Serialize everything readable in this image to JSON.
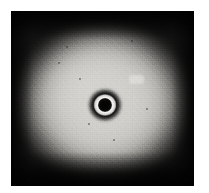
{
  "figure": {
    "kind": "photographic-plate-image",
    "caption": "",
    "alt_text": "Grayscale photographic plate showing a broad diffuse bright halo on a dark background with a sharp dark central spot encircled by a thin bright ring",
    "width_px": 209,
    "height_px": 193
  },
  "plate": {
    "label": "plate",
    "left_px": 11,
    "top_px": 11,
    "width_px": 183,
    "height_px": 175,
    "background_color": "#0a0a0a",
    "paper_margin_color": "#ffffff"
  },
  "halo": {
    "label": "diffuse halo",
    "center_x_px": 105,
    "center_y_px": 102,
    "outer_width_px": 196,
    "outer_height_px": 178,
    "peak_gray": "#d0cfcb",
    "edge_gray": "#101010",
    "shape": "ellipse"
  },
  "center_spot": {
    "label": "central spot",
    "center_x_px": 105,
    "center_y_px": 105,
    "core_diameter_px": 14,
    "ring_diameter_px": 23,
    "annulus_diameter_px": 36,
    "core_color": "#030303",
    "ring_color": "#f6f5f3",
    "annulus_color": "#0a0a0a"
  },
  "artifacts": {
    "defect_patch": {
      "label": "bright emulsion patch",
      "x_px": 118,
      "y_px": 64,
      "width_px": 15,
      "height_px": 9,
      "color": "#ecebe8"
    },
    "specks": [
      {
        "label": "dark speck",
        "x_px": 58,
        "y_px": 62,
        "size_px": 2
      },
      {
        "label": "dark speck",
        "x_px": 79,
        "y_px": 78,
        "size_px": 2
      },
      {
        "label": "dark speck",
        "x_px": 66,
        "y_px": 46,
        "size_px": 2
      },
      {
        "label": "dark speck",
        "x_px": 131,
        "y_px": 40,
        "size_px": 2
      },
      {
        "label": "dark speck",
        "x_px": 113,
        "y_px": 139,
        "size_px": 2
      },
      {
        "label": "dark speck",
        "x_px": 88,
        "y_px": 123,
        "size_px": 2
      },
      {
        "label": "dark speck",
        "x_px": 146,
        "y_px": 108,
        "size_px": 2
      }
    ]
  },
  "palette": {
    "paper_white": "#ffffff",
    "halo_bright": "#d0cfcb",
    "ring_white": "#f6f5f3",
    "field_dark": "#0a0a0a",
    "core_black": "#030303"
  }
}
